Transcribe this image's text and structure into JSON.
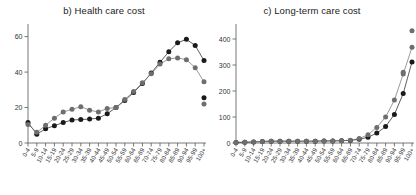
{
  "figure": {
    "background": "#ffffff",
    "panel_count": 2
  },
  "chart_data": [
    {
      "type": "line",
      "title": "b) Health care cost",
      "xlabel": "",
      "ylabel": "",
      "xlim": [
        0,
        20
      ],
      "ylim": [
        0,
        66
      ],
      "yticks": [
        0,
        20,
        40,
        60
      ],
      "ytick_labels": [
        "0",
        "20",
        "40",
        "60"
      ],
      "grid": false,
      "legend": "none",
      "categories": [
        "0-4",
        "5-9",
        "10-14",
        "15-19",
        "20-24",
        "25-29",
        "30-34",
        "35-39",
        "40-44",
        "45-49",
        "50-54",
        "55-59",
        "60-64",
        "65-69",
        "70-74",
        "75-79",
        "80-84",
        "85-89",
        "90-94",
        "95-99",
        "100+"
      ],
      "series": [
        {
          "name": "series-dark",
          "color": "#1a1a1a",
          "values": [
            11.5,
            5.0,
            8.0,
            9.8,
            11.5,
            13.0,
            13.2,
            13.5,
            14.0,
            16.5,
            20.0,
            24.0,
            28.5,
            33.5,
            39.5,
            45.5,
            51.5,
            56.5,
            58.5,
            55.0,
            46.5
          ]
        },
        {
          "name": "series-gray",
          "color": "#6e6e6e",
          "values": [
            10.5,
            6.0,
            10.0,
            14.0,
            17.5,
            19.0,
            20.5,
            18.5,
            17.5,
            19.5,
            20.0,
            24.5,
            29.0,
            34.0,
            39.0,
            44.5,
            47.5,
            48.0,
            47.0,
            42.5,
            34.5
          ]
        }
      ],
      "extra_points": [
        {
          "name": "tail-dark",
          "color": "#1a1a1a",
          "x": 20,
          "y": 25.5
        },
        {
          "name": "tail-gray",
          "color": "#6e6e6e",
          "x": 20,
          "y": 22.0
        }
      ]
    },
    {
      "type": "line",
      "title": "c) Long-term care cost",
      "xlabel": "",
      "ylabel": "",
      "xlim": [
        0,
        20
      ],
      "ylim": [
        0,
        450
      ],
      "yticks": [
        0,
        100,
        200,
        300,
        400
      ],
      "ytick_labels": [
        "0",
        "100",
        "200",
        "300",
        "400"
      ],
      "grid": false,
      "legend": "none",
      "categories": [
        "0-4",
        "5-9",
        "10-14",
        "15-19",
        "20-24",
        "25-29",
        "30-34",
        "35-39",
        "40-44",
        "45-49",
        "50-54",
        "55-59",
        "60-64",
        "65-69",
        "70-74",
        "75-79",
        "80-84",
        "85-89",
        "90-94",
        "95-99",
        "100+"
      ],
      "series": [
        {
          "name": "series-dark",
          "color": "#1a1a1a",
          "values": [
            2,
            3,
            4,
            6,
            7,
            7,
            7,
            7,
            7,
            7,
            8,
            8,
            9,
            10,
            14,
            22,
            38,
            63,
            110,
            190,
            312
          ]
        },
        {
          "name": "series-gray",
          "color": "#6e6e6e",
          "values": [
            2,
            3,
            4,
            6,
            7,
            7,
            7,
            7,
            7,
            7,
            8,
            8,
            9,
            11,
            17,
            32,
            60,
            100,
            165,
            265,
            368
          ]
        }
      ],
      "extra_points": [
        {
          "name": "tail-gray-high",
          "color": "#6e6e6e",
          "x": 20,
          "y": 432
        },
        {
          "name": "tail-gray-mid",
          "color": "#6e6e6e",
          "x": 19,
          "y": 272
        }
      ]
    }
  ]
}
